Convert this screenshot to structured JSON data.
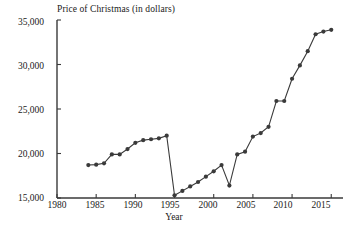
{
  "chart_data": {
    "type": "line",
    "title": "Price of Christmas (in dollars)",
    "xlabel": "Year",
    "ylabel": "",
    "xlim": [
      1980,
      2016.5
    ],
    "ylim": [
      15000,
      35000
    ],
    "grid": false,
    "legend": "none",
    "marker": "filled-circle",
    "line_color": "#3a3a3a",
    "marker_color": "#3a3a3a",
    "xticks": [
      1980,
      1985,
      1990,
      1995,
      2000,
      2005,
      2010,
      2015
    ],
    "xtick_labels": [
      "1980",
      "1985",
      "1990",
      "1995",
      "2000",
      "2005",
      "2010",
      "2015"
    ],
    "yticks": [
      15000,
      20000,
      25000,
      30000,
      35000
    ],
    "ytick_labels": [
      "15,000",
      "20,000",
      "25,000",
      "30,000",
      "35,000"
    ],
    "x": [
      1984,
      1985,
      1986,
      1987,
      1988,
      1989,
      1990,
      1991,
      1992,
      1993,
      1994,
      1995,
      1996,
      1997,
      1998,
      1999,
      2000,
      2001,
      2002,
      2003,
      2004,
      2005,
      2006,
      2007,
      2008,
      2009,
      2010,
      2011,
      2012,
      2013,
      2014,
      2015
    ],
    "values": [
      18700,
      18750,
      18900,
      19900,
      19900,
      20500,
      21200,
      21500,
      21600,
      21700,
      22000,
      15300,
      15800,
      16300,
      16800,
      17400,
      18000,
      18700,
      16400,
      19900,
      20200,
      21900,
      22300,
      23000,
      25900,
      25900,
      28400,
      29900,
      31500,
      33400,
      33700,
      33900
    ],
    "annotations": [
      {
        "label": "sharp drop from 1994 to 1995",
        "x_from": 1994,
        "x_to": 1995
      },
      {
        "label": "dip at 2002",
        "x": 2002
      },
      {
        "label": "flat 2008-2009 plateau",
        "x_from": 2008,
        "x_to": 2009
      }
    ]
  },
  "axes": {
    "title": "Price of Christmas (in dollars)",
    "xlabel": "Year",
    "ytick_labels": [
      "35,000",
      "30,000",
      "25,000",
      "20,000",
      "15,000"
    ],
    "xtick_labels": [
      "1980",
      "1985",
      "1990",
      "1995",
      "2000",
      "2005",
      "2010",
      "2015"
    ]
  }
}
